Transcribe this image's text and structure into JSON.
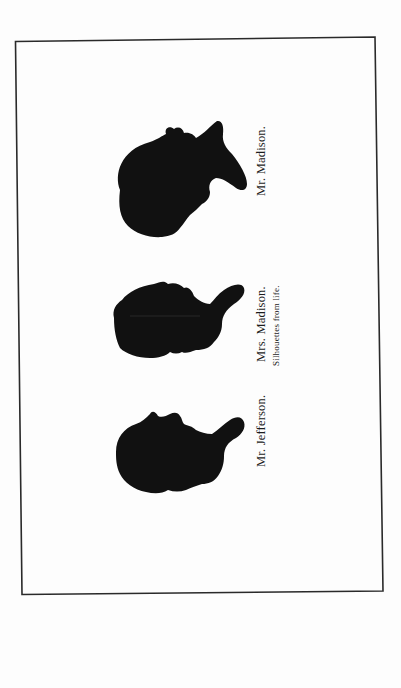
{
  "plate": {
    "orientation": "rotated-90-ccw",
    "frame_color": "#2a2a2a",
    "silhouette_color": "#111111",
    "figures": [
      {
        "id": "madison",
        "caption": "Mr.  Madison."
      },
      {
        "id": "mrs-madison",
        "caption": "Mrs.  Madison.",
        "subcaption": "Silhouettes from life."
      },
      {
        "id": "jefferson",
        "caption": "Mr.  Jefferson."
      }
    ]
  }
}
